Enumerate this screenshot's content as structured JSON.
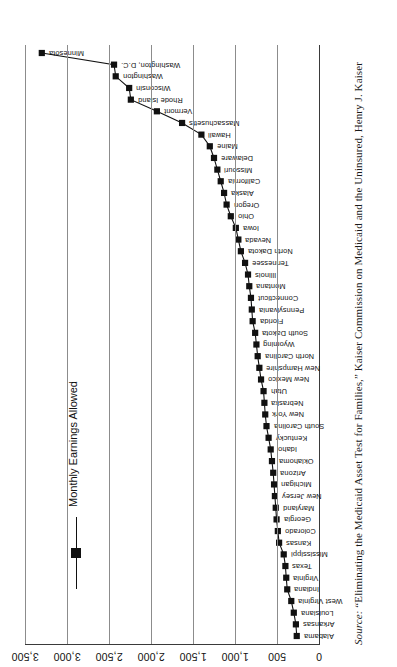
{
  "figure": {
    "legend_label": "Monthly Earnings Allowed",
    "source_note_lead": "Source:",
    "source_note_text": " “Eliminating the Medicaid Asset Test for Families,” Kaiser Commission on Medicaid and the Uninsured, Henry J. Kaiser"
  },
  "axis": {
    "tick_labels": [
      "3,500",
      "3,000",
      "2,500",
      "2,000",
      "1,500",
      "1,000",
      "500",
      "0"
    ]
  },
  "chart_data": {
    "type": "line",
    "title": "",
    "subtitle": "",
    "xlabel": "",
    "ylabel": "",
    "ylim": [
      0,
      3500
    ],
    "grid": true,
    "legend_position": "inside-upper-left",
    "series_name": "Monthly Earnings Allowed",
    "orientation": "page-rotated-90",
    "marker": "filled-square",
    "categories": [
      "Alabama",
      "Arkansas",
      "Louisiana",
      "West Virginia",
      "Indiana",
      "Virginia",
      "Texas",
      "Mississippi",
      "Kansas",
      "Colorado",
      "Georgia",
      "Maryland",
      "New Jersey",
      "Michigan",
      "Arizona",
      "Oklahoma",
      "Idaho",
      "Kentucky",
      "South Carolina",
      "New York",
      "Nebraska",
      "Utah",
      "New Mexico",
      "New Hampshire",
      "North Carolina",
      "Wyoming",
      "South Dakota",
      "Florida",
      "Pennsylvania",
      "Connecticut",
      "Montana",
      "Illinois",
      "Tennessee",
      "North Dakota",
      "Nevada",
      "Iowa",
      "Ohio",
      "Oregon",
      "Alaska",
      "California",
      "Missouri",
      "Delaware",
      "Maine",
      "Hawaii",
      "Massachusetts",
      "Vermont",
      "Rhode Island",
      "Wisconsin",
      "Washington",
      "Washington, D.C.",
      "Minnesota"
    ],
    "values": [
      265,
      275,
      300,
      330,
      378,
      390,
      400,
      420,
      475,
      490,
      505,
      515,
      525,
      535,
      545,
      560,
      575,
      600,
      625,
      640,
      650,
      660,
      690,
      710,
      730,
      745,
      760,
      790,
      800,
      810,
      830,
      845,
      880,
      930,
      960,
      990,
      1050,
      1100,
      1130,
      1170,
      1210,
      1250,
      1300,
      1400,
      1630,
      1930,
      2240,
      2260,
      2420,
      2440,
      3300
    ]
  }
}
